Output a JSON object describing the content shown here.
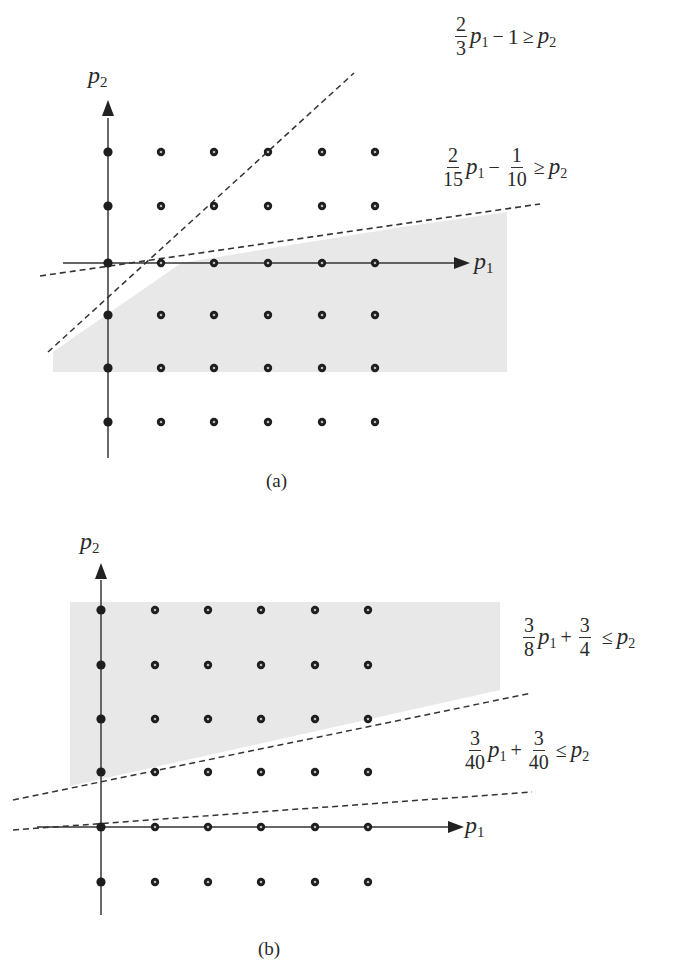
{
  "figures": [
    {
      "id": "a",
      "caption": "(a)",
      "axis_labels": {
        "x": "p",
        "x_sub": "1",
        "y": "p",
        "y_sub": "2"
      },
      "inequalities": [
        {
          "num1": "2",
          "den1": "3",
          "var": "p",
          "var_sub": "1",
          "op1": "−",
          "const": "1",
          "rel": "≥",
          "rhs": "p",
          "rhs_sub": "2",
          "text": "2/3 p1 − 1 ≥ p2"
        },
        {
          "num1": "2",
          "den1": "15",
          "var": "p",
          "var_sub": "1",
          "op1": "−",
          "num2": "1",
          "den2": "10",
          "rel": "≥",
          "rhs": "p",
          "rhs_sub": "2",
          "text": "2/15 p1 − 1/10 ≥ p2"
        }
      ],
      "shaded_region": "below both constraint lines",
      "fill_color": "#e6e6e6"
    },
    {
      "id": "b",
      "caption": "(b)",
      "axis_labels": {
        "x": "p",
        "x_sub": "1",
        "y": "p",
        "y_sub": "2"
      },
      "inequalities": [
        {
          "num1": "3",
          "den1": "8",
          "var": "p",
          "var_sub": "1",
          "op1": "+",
          "num2": "3",
          "den2": "4",
          "rel": "≤",
          "rhs": "p",
          "rhs_sub": "2",
          "text": "3/8 p1 + 3/4 ≤ p2"
        },
        {
          "num1": "3",
          "den1": "40",
          "var": "p",
          "var_sub": "1",
          "op1": "+",
          "num2": "3",
          "den2": "40",
          "rel": "≤",
          "rhs": "p",
          "rhs_sub": "2",
          "text": "3/40 p1 + 3/40 ≤ p2"
        }
      ],
      "shaded_region": "above both constraint lines",
      "fill_color": "#e6e6e6"
    }
  ],
  "lattice": {
    "a": {
      "cols_x": [
        108,
        161,
        214,
        268,
        322,
        375
      ],
      "rows_y": [
        152,
        206,
        263,
        315,
        368,
        422
      ]
    },
    "b": {
      "cols_x": [
        101,
        155,
        208,
        261,
        315,
        368
      ],
      "rows_y": [
        610,
        665,
        719,
        772,
        827,
        882
      ]
    }
  }
}
